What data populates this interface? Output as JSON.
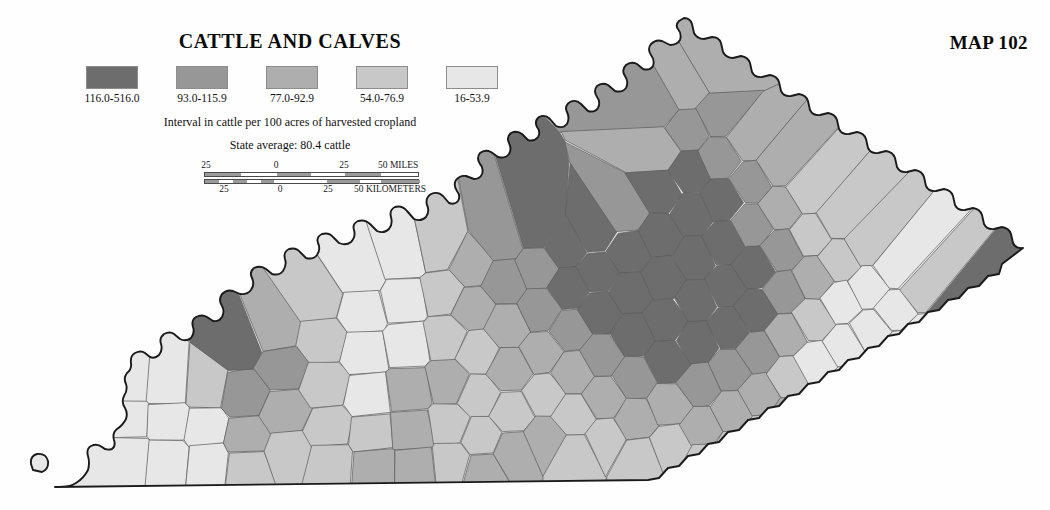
{
  "header": {
    "title": "CATTLE AND CALVES",
    "map_number": "MAP 102"
  },
  "legend": {
    "caption": "Interval in cattle per 100 acres of harvested cropland",
    "average": "State average: 80.4 cattle",
    "classes": [
      {
        "label": "116.0-516.0",
        "color": "#6d6d6d",
        "min": 116.0,
        "max": 516.0
      },
      {
        "label": "93.0-115.9",
        "color": "#979797",
        "min": 93.0,
        "max": 115.9
      },
      {
        "label": "77.0-92.9",
        "color": "#aeaeae",
        "min": 77.0,
        "max": 92.9
      },
      {
        "label": "54.0-76.9",
        "color": "#c8c8c8",
        "min": 54.0,
        "max": 76.9
      },
      {
        "label": "16-53.9",
        "color": "#e7e7e7",
        "min": 16.0,
        "max": 53.9
      }
    ]
  },
  "scalebar": {
    "miles_labels": [
      "25",
      "0",
      "25",
      "50 MILES"
    ],
    "kilometers_labels": [
      "25",
      "0",
      "25",
      "50 KILOMETERS"
    ]
  },
  "chart_data": {
    "type": "choropleth",
    "title": "CATTLE AND CALVES",
    "subtitle": "Interval in cattle per 100 acres of harvested cropland",
    "annotation": "State average: 80.4 cattle",
    "region": "Kentucky",
    "unit": "cattle per 100 acres of harvested cropland",
    "state_average": 80.4,
    "legend_position": "top-left",
    "classes": [
      {
        "label": "116.0-516.0",
        "color": "#6d6d6d"
      },
      {
        "label": "93.0-115.9",
        "color": "#979797"
      },
      {
        "label": "77.0-92.9",
        "color": "#aeaeae"
      },
      {
        "label": "54.0-76.9",
        "color": "#c8c8c8"
      },
      {
        "label": "16-53.9",
        "color": "#e7e7e7"
      }
    ],
    "class_counts": [
      31,
      24,
      21,
      24,
      20
    ]
  },
  "map_regions": {
    "far_west": "Jackson Purchase — predominantly lightest class (16-53.9)",
    "central": "Bluegrass — predominantly darkest class (116.0-516.0)",
    "east": "Eastern Coal Field — mixed, mostly light with dark far-eastern county"
  }
}
